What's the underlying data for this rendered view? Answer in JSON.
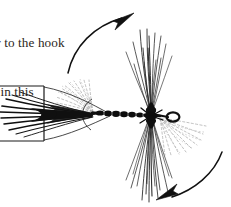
{
  "page": {
    "width": 231,
    "height": 207,
    "background_color": "#ffffff",
    "kind": "book-page-fragment"
  },
  "caption": {
    "note": "left-cropped body text at top-left of the page",
    "lines": [
      "cular to the hook",
      "own in this",
      "w."
    ],
    "line1": "cular to the hook",
    "line2": "own in this",
    "line3": "w.",
    "text_color": "#2b2622"
  },
  "figure": {
    "name": "fishing-fly-hackle-rotation-diagram",
    "ink_color": "#1a1a1a",
    "ghost_color": "#9a9a9a",
    "parts": [
      {
        "name": "hook-shank-body",
        "label": "dark segmented dubbed body along the hook shank"
      },
      {
        "name": "hook-eye",
        "label": "small dark wire loop at the right end"
      },
      {
        "name": "tail-fibers",
        "label": "long straight fibers splaying to the left"
      },
      {
        "name": "measuring-bracket",
        "label": "rectangular frame around the tail, cropped at the left page edge"
      },
      {
        "name": "hackle-upper",
        "label": "upright splayed hackle fibers above the hook"
      },
      {
        "name": "hackle-lower",
        "label": "splayed hackle fibers below the hook"
      },
      {
        "name": "ghost-hackle-upper-left",
        "label": "dashed fan showing the former flat hackle position, upper left"
      },
      {
        "name": "ghost-hackle-lower-right",
        "label": "dashed fan showing the former flat hackle position, lower right"
      },
      {
        "name": "rotation-arrow-up",
        "label": "curved arrow sweeping from lower-left up to the right"
      },
      {
        "name": "rotation-arrow-down",
        "label": "curved arrow sweeping from the right down to the lower-left"
      }
    ]
  }
}
